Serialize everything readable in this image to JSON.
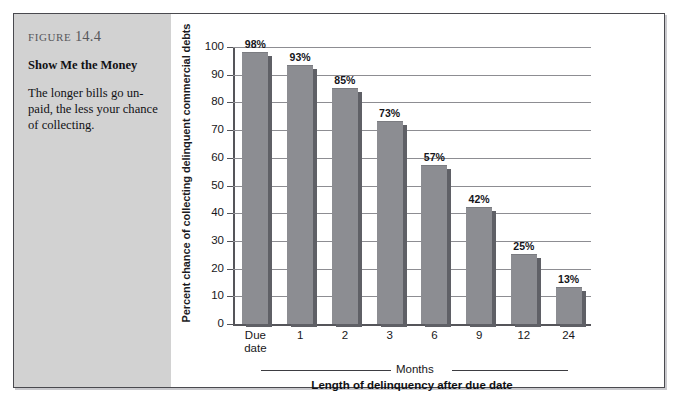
{
  "figure": {
    "number_word": "Figure",
    "number": "14.4",
    "title": "Show Me the Money",
    "body": "The longer bills go un-paid, the less your chance of collecting."
  },
  "chart_data": {
    "type": "bar",
    "title": "Show Me the Money",
    "xlabel": "Length of delinquency after due date",
    "ylabel": "Percent chance of collecting  delinquent commercial debts",
    "categories": [
      "Due date",
      "1",
      "2",
      "3",
      "6",
      "9",
      "12",
      "24"
    ],
    "values": [
      98,
      93,
      85,
      73,
      57,
      42,
      25,
      13
    ],
    "value_labels": [
      "98%",
      "93%",
      "85%",
      "73%",
      "57%",
      "42%",
      "25%",
      "13%"
    ],
    "ylim": [
      0,
      100
    ],
    "ytick_labels": [
      "0",
      "10",
      "20",
      "30",
      "40",
      "50",
      "60",
      "70",
      "80",
      "90",
      "100"
    ],
    "yticks": [
      0,
      10,
      20,
      30,
      40,
      50,
      60,
      70,
      80,
      90,
      100
    ],
    "grid": true,
    "legend": false,
    "group_bracket_label": "Months",
    "colors": {
      "bar_face": "#8c8d92",
      "bar_shadow": "#5f6066",
      "gridline": "#8d8d92",
      "axis": "#55555a",
      "caption_panel": "#d2d2d2",
      "frame_border": "#4a4a4f"
    }
  }
}
